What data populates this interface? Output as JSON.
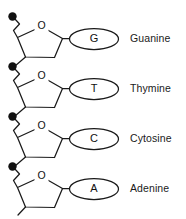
{
  "diagram": {
    "background_color": "#ffffff",
    "line_color": "#1a1a1a",
    "phosphate_color": "#111111",
    "sugar_oxygen_label": "O",
    "units": [
      {
        "base_letter": "G",
        "base_name": "Guanine",
        "phosphate_label": "phosphate",
        "sugar_label": "deoxyribose",
        "y_offset": 0
      },
      {
        "base_letter": "T",
        "base_name": "Thymine",
        "phosphate_label": "phosphate",
        "sugar_label": "deoxyribose",
        "y_offset": 50
      },
      {
        "base_letter": "C",
        "base_name": "Cytosine",
        "phosphate_label": "phosphate",
        "sugar_label": "deoxyribose",
        "y_offset": 100
      },
      {
        "base_letter": "A",
        "base_name": "Adenine",
        "phosphate_label": "phosphate",
        "sugar_label": "deoxyribose",
        "y_offset": 150
      }
    ]
  }
}
